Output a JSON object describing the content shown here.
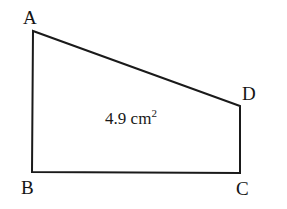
{
  "figure": {
    "name": "right-trapezoid-abcd",
    "background_color": "#ffffff",
    "stroke_color": "#1a1a1a",
    "stroke_width": 2,
    "vertices": [
      {
        "label": "A",
        "x": 33,
        "y": 31
      },
      {
        "label": "B",
        "x": 32,
        "y": 172
      },
      {
        "label": "C",
        "x": 240,
        "y": 173
      },
      {
        "label": "D",
        "x": 240,
        "y": 106
      }
    ],
    "edges": [
      {
        "name": "edge-ab",
        "from": "A",
        "to": "B"
      },
      {
        "name": "edge-bc",
        "from": "B",
        "to": "C"
      },
      {
        "name": "edge-cd",
        "from": "C",
        "to": "D"
      },
      {
        "name": "edge-da",
        "from": "D",
        "to": "A"
      }
    ],
    "labels": {
      "a": "A",
      "b": "B",
      "c": "C",
      "d": "D"
    },
    "area": {
      "value": "4.9",
      "unit": "cm",
      "exponent": "2",
      "text": "4.9 cm²"
    }
  }
}
